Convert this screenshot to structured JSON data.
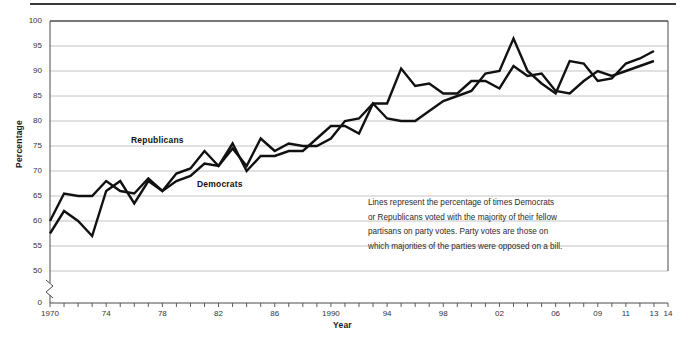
{
  "chart_data": {
    "type": "line",
    "title": "",
    "subtitle": "",
    "xlabel": "Year",
    "ylabel": "Percentage",
    "xlim": [
      1970,
      2014
    ],
    "ylim": [
      50,
      100
    ],
    "y_axis_break_below": 50,
    "y_zero_tick": "0",
    "grid": "horizontal",
    "legend_position": "inline-labels",
    "yticks": [
      50,
      55,
      60,
      65,
      70,
      75,
      80,
      85,
      90,
      95,
      100
    ],
    "ytick_labels": [
      "50",
      "55",
      "60",
      "65",
      "70",
      "75",
      "80",
      "85",
      "90",
      "95",
      "100"
    ],
    "xticks": [
      1970,
      1974,
      1978,
      1982,
      1986,
      1990,
      1994,
      1998,
      2002,
      2006,
      2009,
      2011,
      2013,
      2014
    ],
    "xtick_labels": [
      "1970",
      "74",
      "78",
      "82",
      "86",
      "1990",
      "94",
      "98",
      "02",
      "06",
      "09",
      "11",
      "13",
      "14"
    ],
    "x": [
      1970,
      1971,
      1972,
      1973,
      1974,
      1975,
      1976,
      1977,
      1978,
      1979,
      1980,
      1981,
      1982,
      1983,
      1984,
      1985,
      1986,
      1987,
      1988,
      1989,
      1990,
      1991,
      1992,
      1993,
      1994,
      1995,
      1996,
      1997,
      1998,
      1999,
      2000,
      2001,
      2002,
      2003,
      2004,
      2005,
      2006,
      2007,
      2008,
      2009,
      2010,
      2011,
      2012,
      2013
    ],
    "series": [
      {
        "name": "Republicans",
        "color": "#111111",
        "values": [
          60.0,
          65.5,
          65.0,
          65.0,
          68.0,
          66.0,
          65.5,
          68.5,
          66.0,
          69.5,
          70.5,
          74.0,
          71.0,
          74.5,
          71.0,
          76.5,
          74.0,
          75.5,
          75.0,
          75.0,
          76.5,
          80.0,
          80.5,
          83.5,
          83.5,
          90.5,
          87.0,
          87.5,
          85.5,
          85.5,
          88.0,
          88.0,
          86.5,
          91.0,
          89.0,
          89.5,
          86.0,
          85.5,
          88.0,
          90.0,
          89.0,
          90.0,
          91.0,
          92.0
        ]
      },
      {
        "name": "Democrats",
        "color": "#111111",
        "values": [
          57.5,
          62.0,
          60.0,
          57.0,
          66.0,
          68.0,
          63.5,
          68.0,
          66.0,
          68.0,
          69.0,
          71.5,
          71.0,
          75.5,
          70.0,
          73.0,
          73.0,
          74.0,
          74.0,
          76.5,
          79.0,
          79.0,
          77.5,
          83.5,
          80.5,
          80.0,
          80.0,
          82.0,
          84.0,
          85.0,
          86.0,
          89.5,
          90.0,
          96.5,
          90.0,
          87.5,
          85.5,
          92.0,
          91.5,
          88.0,
          88.5,
          91.5,
          92.5,
          94.0
        ]
      }
    ],
    "series_label_positions": [
      {
        "name": "Republicans",
        "left": 131,
        "top": 135
      },
      {
        "name": "Democrats",
        "left": 197,
        "top": 179
      }
    ],
    "annotations": [
      {
        "name": "methodology-note",
        "lines": [
          "Lines represent the percentage of times Democrats",
          "or Republicans voted with the majority of their fellow",
          "partisans on party votes. Party votes are those on",
          "which majorities of the parties were opposed on a bill."
        ]
      }
    ],
    "style": {
      "line_color": "#111111",
      "line_width": 2.4,
      "grid_color": "#b5b5b5",
      "frame_color": "#4a4a4a",
      "background": "#ffffff"
    },
    "geometry": {
      "plot_left": 50,
      "plot_right": 668,
      "plot_top": 21,
      "plot_bottom_50": 271,
      "axis_base": 303
    }
  }
}
